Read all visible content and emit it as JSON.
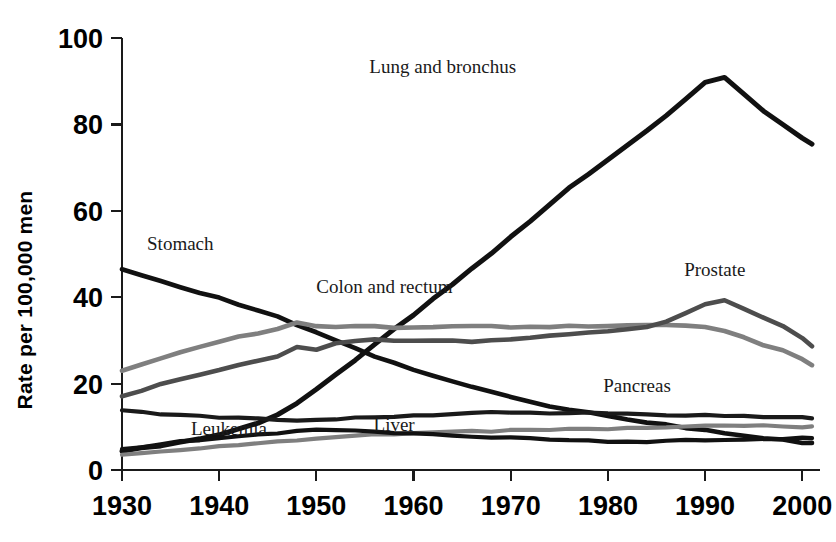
{
  "chart_data": {
    "type": "line",
    "title": "",
    "subtitle": "",
    "xlabel": "",
    "ylabel": "Rate per 100,000 men",
    "xlim": [
      1930,
      2001
    ],
    "ylim": [
      0,
      100
    ],
    "grid": false,
    "legend_position": "inline-annotations",
    "xticks": [
      "1930",
      "1940",
      "1950",
      "1960",
      "1970",
      "1980",
      "1990",
      "2000"
    ],
    "xtick_values": [
      1930,
      1940,
      1950,
      1960,
      1970,
      1980,
      1990,
      2000
    ],
    "yticks": [
      "0",
      "20",
      "40",
      "60",
      "80",
      "100"
    ],
    "ytick_values": [
      0,
      20,
      40,
      60,
      80,
      100
    ],
    "x": [
      1930,
      1932,
      1934,
      1936,
      1938,
      1940,
      1942,
      1944,
      1946,
      1948,
      1950,
      1952,
      1954,
      1956,
      1958,
      1960,
      1962,
      1964,
      1966,
      1968,
      1970,
      1972,
      1974,
      1976,
      1978,
      1980,
      1982,
      1984,
      1986,
      1988,
      1990,
      1992,
      1994,
      1996,
      1998,
      2000,
      2001
    ],
    "series": [
      {
        "name": "Lung and bronchus",
        "color": "#111111",
        "width": 5.0,
        "label_x": 1963,
        "label_y": 92,
        "values": [
          4.5,
          5.0,
          5.6,
          6.4,
          7.2,
          8.2,
          9.4,
          10.8,
          12.8,
          15.6,
          18.8,
          22.0,
          25.6,
          29.2,
          32.6,
          36.0,
          39.6,
          43.0,
          46.6,
          50.2,
          54.0,
          57.6,
          61.4,
          65.2,
          68.4,
          71.8,
          75.0,
          78.4,
          82.0,
          86.0,
          89.8,
          90.8,
          87.0,
          83.0,
          80.0,
          77.0,
          75.6
        ]
      },
      {
        "name": "Stomach",
        "color": "#111111",
        "width": 4.6,
        "label_x": 1936,
        "label_y": 51,
        "values": [
          46.5,
          45.0,
          43.6,
          42.2,
          41.0,
          39.8,
          38.4,
          37.0,
          35.4,
          33.6,
          31.8,
          30.0,
          28.2,
          26.4,
          24.8,
          23.2,
          21.8,
          20.4,
          19.2,
          18.0,
          16.8,
          15.8,
          14.8,
          14.0,
          13.2,
          12.4,
          11.6,
          11.0,
          10.4,
          9.8,
          9.2,
          8.6,
          8.0,
          7.5,
          7.0,
          6.4,
          6.2
        ]
      },
      {
        "name": "Colon and rectum",
        "color": "#7f7f7f",
        "width": 4.6,
        "label_x": 1957,
        "label_y": 41,
        "values": [
          23.0,
          24.4,
          25.8,
          27.2,
          28.6,
          29.8,
          30.8,
          31.6,
          32.6,
          34.2,
          33.4,
          33.2,
          33.2,
          33.2,
          33.0,
          33.0,
          33.0,
          33.2,
          33.2,
          33.2,
          33.0,
          33.2,
          33.2,
          33.4,
          33.2,
          33.4,
          33.4,
          33.4,
          33.6,
          33.4,
          33.0,
          32.0,
          30.6,
          29.0,
          27.6,
          25.6,
          24.4
        ]
      },
      {
        "name": "Prostate",
        "color": "#4d4d4d",
        "width": 4.6,
        "label_x": 1991,
        "label_y": 45,
        "values": [
          17.0,
          18.4,
          19.8,
          21.0,
          22.0,
          23.2,
          24.2,
          25.2,
          26.4,
          28.4,
          28.0,
          29.2,
          30.0,
          30.2,
          30.0,
          29.8,
          29.8,
          29.8,
          29.8,
          30.0,
          30.2,
          30.6,
          31.0,
          31.4,
          31.8,
          32.2,
          32.6,
          33.2,
          34.4,
          36.4,
          38.4,
          39.2,
          37.4,
          35.2,
          33.2,
          30.4,
          28.8
        ]
      },
      {
        "name": "Pancreas",
        "color": "#1a1a1a",
        "width": 4.2,
        "label_x": 1983,
        "label_y": 18,
        "values": [
          14.0,
          13.4,
          13.0,
          12.6,
          12.4,
          12.2,
          12.0,
          11.8,
          11.6,
          11.4,
          11.6,
          11.8,
          12.0,
          12.2,
          12.4,
          12.6,
          12.8,
          13.0,
          13.2,
          13.4,
          13.4,
          13.4,
          13.2,
          13.2,
          13.2,
          13.0,
          13.0,
          12.8,
          12.8,
          12.6,
          12.6,
          12.4,
          12.4,
          12.2,
          12.2,
          12.2,
          12.1
        ]
      },
      {
        "name": "Leukemia",
        "color": "#7f7f7f",
        "width": 4.2,
        "label_x": 1941,
        "label_y": 8,
        "values": [
          3.4,
          3.8,
          4.2,
          4.6,
          5.0,
          5.4,
          5.8,
          6.2,
          6.6,
          7.0,
          7.4,
          7.8,
          8.0,
          8.2,
          8.4,
          8.6,
          8.8,
          8.8,
          9.0,
          9.0,
          9.2,
          9.2,
          9.4,
          9.4,
          9.6,
          9.6,
          9.8,
          9.8,
          10.0,
          10.0,
          10.2,
          10.2,
          10.2,
          10.2,
          10.2,
          10.0,
          10.0
        ]
      },
      {
        "name": "Liver",
        "color": "#111111",
        "width": 4.2,
        "label_x": 1958,
        "label_y": 9,
        "values": [
          4.8,
          5.4,
          6.0,
          6.6,
          7.0,
          7.4,
          7.8,
          8.2,
          8.6,
          9.0,
          9.2,
          9.2,
          9.0,
          8.8,
          8.6,
          8.4,
          8.2,
          8.0,
          7.8,
          7.6,
          7.4,
          7.2,
          7.0,
          6.8,
          6.8,
          6.6,
          6.6,
          6.6,
          6.8,
          6.8,
          6.8,
          7.0,
          7.0,
          7.2,
          7.2,
          7.4,
          7.4
        ]
      }
    ]
  }
}
